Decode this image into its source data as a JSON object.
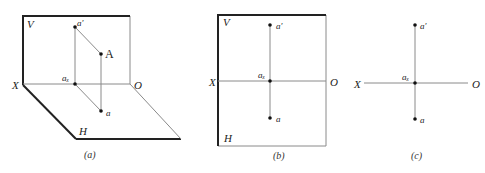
{
  "figure": {
    "panels": [
      {
        "id": "a",
        "caption": "(a)",
        "plane_v_label": "V",
        "plane_h_label": "H",
        "axis_start_label": "X",
        "axis_end_label": "O",
        "point_space_label": "A",
        "point_v_proj_label": "a′",
        "point_axis_label": "aₓ",
        "point_h_proj_label": "a"
      },
      {
        "id": "b",
        "caption": "(b)",
        "plane_v_label": "V",
        "plane_h_label": "H",
        "axis_start_label": "X",
        "axis_end_label": "O",
        "point_v_proj_label": "a′",
        "point_axis_label": "aₓ",
        "point_h_proj_label": "a"
      },
      {
        "id": "c",
        "caption": "(c)",
        "axis_start_label": "X",
        "axis_end_label": "O",
        "point_v_proj_label": "a′",
        "point_axis_label": "aₓ",
        "point_h_proj_label": "a"
      }
    ],
    "colors": {
      "thick_edge": "#222222",
      "thin_line": "#8a8a8a",
      "point": "#111111"
    }
  }
}
